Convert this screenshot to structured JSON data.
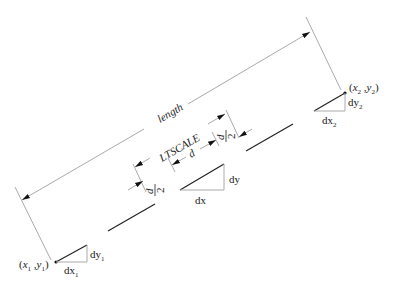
{
  "diagram": {
    "type": "linetype-scale-dimension-diagram",
    "labels": {
      "length": "length",
      "ltscale": "LTSCALE",
      "d": "d",
      "d_half_num": "d",
      "d_half_den": "2",
      "dx": "dx",
      "dy": "dy",
      "dx1": "dx",
      "dx1_sub": "1",
      "dy1": "dy",
      "dy1_sub": "1",
      "dx2": "dx",
      "dx2_sub": "2",
      "dy2": "dy",
      "dy2_sub": "2",
      "p1_open": "(",
      "p1_x": "x",
      "p1_xsub": "1",
      "p1_sep": " ,",
      "p1_y": "y",
      "p1_ysub": "1",
      "p1_close": ")",
      "p2_open": "(",
      "p2_x": "x",
      "p2_xsub": "2",
      "p2_sep": " ,",
      "p2_y": "y",
      "p2_ysub": "2",
      "p2_close": ")"
    },
    "colors": {
      "ink": "#222222",
      "dimension_line": "#aaaaaa",
      "background": "#ffffff"
    }
  }
}
